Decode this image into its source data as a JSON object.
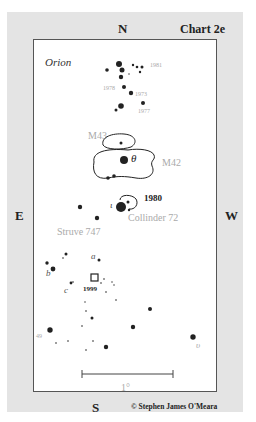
{
  "chart": {
    "title": "Chart 2e",
    "constellation": "Orion",
    "directions": {
      "north": "N",
      "south": "S",
      "east": "E",
      "west": "W"
    },
    "credit": "© Stephen James O'Meara",
    "scale_label": "1°"
  },
  "labels": {
    "nebulae": [
      "M43",
      "M42"
    ],
    "clusters": [
      "Struve 747",
      "Collinder 72"
    ],
    "years": [
      "1981",
      "1978",
      "1973",
      "1977",
      "1980",
      "1999"
    ],
    "greek": [
      "θ",
      "ι",
      "υ"
    ],
    "letters": [
      "a",
      "b",
      "c"
    ],
    "other": [
      "49"
    ]
  },
  "colors": {
    "frame_bg": "#e4e4e4",
    "plot_bg": "#ffffff",
    "border": "#555555",
    "faint_label": "#aaaaaa"
  }
}
